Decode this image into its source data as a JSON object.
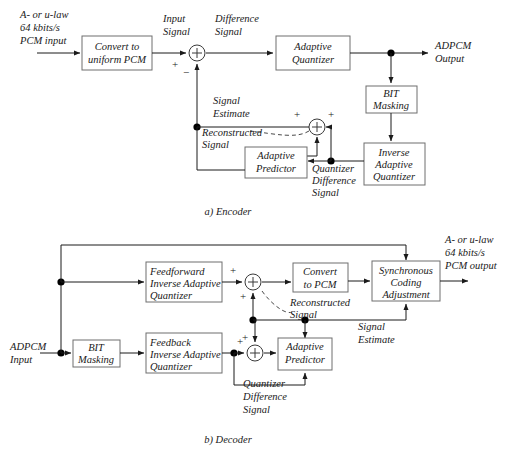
{
  "diagram": {
    "encoder": {
      "caption": "a) Encoder",
      "input_label_lines": [
        "A- or u-law",
        "64 kbits/s",
        "PCM input"
      ],
      "output_label_lines": [
        "ADPCM",
        "Output"
      ],
      "blocks": [
        {
          "id": "convert-to-uniform-pcm",
          "lines": [
            "Convert to",
            "uniform PCM"
          ]
        },
        {
          "id": "adaptive-quantizer",
          "lines": [
            "Adaptive",
            "Quantizer"
          ]
        },
        {
          "id": "bit-masking",
          "lines": [
            "BIT",
            "Masking"
          ]
        },
        {
          "id": "inverse-adaptive-quantizer",
          "lines": [
            "Inverse",
            "Adaptive",
            "Quantizer"
          ]
        },
        {
          "id": "adaptive-predictor",
          "lines": [
            "Adaptive",
            "Predictor"
          ]
        }
      ],
      "signals": [
        {
          "id": "input-signal",
          "lines": [
            "Input",
            "Signal"
          ]
        },
        {
          "id": "difference-signal",
          "lines": [
            "Difference",
            "Signal"
          ]
        },
        {
          "id": "signal-estimate",
          "lines": [
            "Signal",
            "Estimate"
          ]
        },
        {
          "id": "reconstructed-signal",
          "lines": [
            "Reconstructed",
            "Signal"
          ]
        },
        {
          "id": "quantizer-difference-signal",
          "lines": [
            "Quantizer",
            "Difference",
            "Signal"
          ]
        }
      ],
      "signs": {
        "plus": "+",
        "minus": "−"
      }
    },
    "decoder": {
      "caption": "b) Decoder",
      "input_label_lines": [
        "ADPCM",
        "Input"
      ],
      "output_label_lines": [
        "A- or u-law",
        "64 kbits/s",
        "PCM output"
      ],
      "blocks": [
        {
          "id": "feedforward-inverse-adaptive-quantizer",
          "lines": [
            "Feedforward",
            "Inverse Adaptive",
            "Quantizer"
          ]
        },
        {
          "id": "bit-masking",
          "lines": [
            "BIT",
            "Masking"
          ]
        },
        {
          "id": "feedback-inverse-adaptive-quantizer",
          "lines": [
            "Feedback",
            "Inverse Adaptive",
            "Quantizer"
          ]
        },
        {
          "id": "convert-to-pcm",
          "lines": [
            "Convert",
            "to PCM"
          ]
        },
        {
          "id": "synchronous-coding-adjustment",
          "lines": [
            "Synchronous",
            "Coding",
            "Adjustment"
          ]
        },
        {
          "id": "adaptive-predictor",
          "lines": [
            "Adaptive",
            "Predictor"
          ]
        }
      ],
      "signals": [
        {
          "id": "reconstructed-signal",
          "lines": [
            "Reconstructed",
            "Signal"
          ]
        },
        {
          "id": "signal-estimate",
          "lines": [
            "Signal",
            "Estimate"
          ]
        },
        {
          "id": "quantizer-difference-signal",
          "lines": [
            "Quantizer",
            "Difference",
            "Signal"
          ]
        }
      ],
      "signs": {
        "plus": "+"
      }
    },
    "colors": {
      "wire": "#1a1a1a",
      "box_border": "#6e6e6e",
      "background": "#ffffff",
      "text": "#1a1a1a"
    }
  }
}
